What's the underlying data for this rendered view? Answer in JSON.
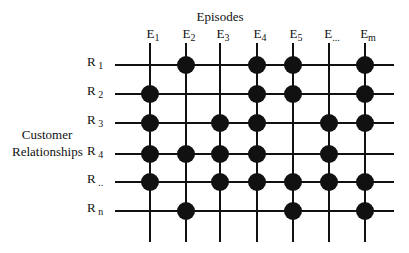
{
  "diagram": {
    "title": "Episodes",
    "row_axis_title_line1": "Customer",
    "row_axis_title_line2": "Relationships",
    "colors": {
      "line": "#111111",
      "dot": "#111111",
      "background": "#ffffff"
    },
    "columns": [
      {
        "base": "E",
        "sub": "1",
        "x": 150
      },
      {
        "base": "E",
        "sub": "2",
        "x": 186
      },
      {
        "base": "E",
        "sub": "3",
        "x": 220
      },
      {
        "base": "E",
        "sub": "4",
        "x": 257
      },
      {
        "base": "E",
        "sub": "5",
        "x": 293
      },
      {
        "base": "E",
        "sub": "...",
        "x": 329
      },
      {
        "base": "E",
        "sub": "m",
        "x": 365
      }
    ],
    "rows": [
      {
        "base": "R",
        "sub": "1",
        "y": 65
      },
      {
        "base": "R",
        "sub": "2",
        "y": 94
      },
      {
        "base": "R",
        "sub": "3",
        "y": 123
      },
      {
        "base": "R",
        "sub": "4",
        "y": 154
      },
      {
        "base": "R",
        "sub": "..",
        "y": 182
      },
      {
        "base": "R",
        "sub": "n",
        "y": 211
      }
    ],
    "membership_matrix": [
      [
        0,
        1,
        0,
        1,
        1,
        0,
        1
      ],
      [
        1,
        0,
        0,
        1,
        1,
        0,
        1
      ],
      [
        1,
        0,
        1,
        1,
        0,
        1,
        1
      ],
      [
        1,
        1,
        1,
        1,
        0,
        1,
        0
      ],
      [
        1,
        0,
        1,
        1,
        1,
        1,
        1
      ],
      [
        0,
        1,
        0,
        0,
        1,
        0,
        1
      ]
    ],
    "grid_extent": {
      "h_line_x1": 115,
      "h_line_x2": 394,
      "v_line_y1": 43,
      "v_line_y2": 242
    },
    "dot_radius": 9
  }
}
